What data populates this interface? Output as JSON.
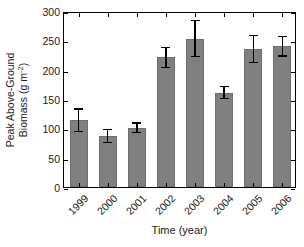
{
  "chart_data": {
    "type": "bar",
    "title": "",
    "xlabel": "Time (year)",
    "ylabel": "Peak Above-Ground Biomass (g m-2)",
    "ylabel_line1": "Peak Above-Ground",
    "ylabel_line2_prefix": "Biomass (g m",
    "ylabel_line2_exponent": "-2",
    "ylabel_line2_suffix": ")",
    "categories": [
      "1999",
      "2000",
      "2001",
      "2002",
      "2003",
      "2004",
      "2005",
      "2006"
    ],
    "values": [
      114,
      87,
      101,
      221,
      253,
      161,
      235,
      240
    ],
    "errors": [
      19,
      11,
      8,
      17,
      31,
      10,
      23,
      17
    ],
    "error_type": "symmetric",
    "ylim": [
      0,
      300
    ],
    "yticks": [
      0,
      50,
      100,
      150,
      200,
      250,
      300
    ],
    "ytick_labels": [
      "0",
      "50",
      "100",
      "150",
      "200",
      "250",
      "300"
    ],
    "grid": false,
    "legend": null,
    "bar_color": "#808080",
    "axis_color": "#000000",
    "error_color": "#000000",
    "xtick_rotation_degrees": -45
  }
}
